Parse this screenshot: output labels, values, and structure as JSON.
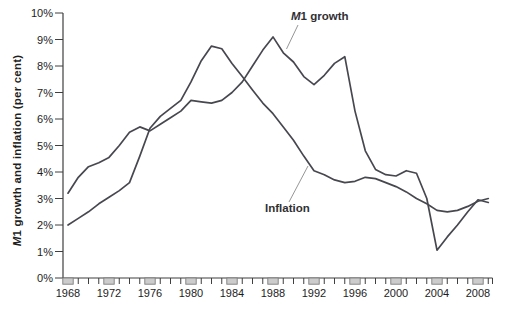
{
  "figure": {
    "ylabel": {
      "italic": "M",
      "rest": "1 growth and inflation (per cent)"
    },
    "series_labels": {
      "m1": {
        "italic": "M",
        "rest": "1 growth"
      },
      "inflation": "Inflation"
    },
    "colors": {
      "line": "#47474f",
      "axis": "#3f3f3f",
      "tick_text": "#1c1c1c",
      "leader": "#8a8a8a",
      "box_fill": "#cccccc",
      "box_stroke": "#7d7d7d"
    }
  },
  "chart_data": {
    "type": "line",
    "title": "",
    "xlabel": "",
    "ylabel": "M1 growth and inflation (per cent)",
    "xlim": [
      1968,
      2009.5
    ],
    "ylim": [
      0,
      10
    ],
    "grid": false,
    "legend_position": "inline-annotations",
    "y_tick_labels": [
      "0%",
      "1%",
      "2%",
      "3%",
      "4%",
      "5%",
      "6%",
      "7%",
      "8%",
      "9%",
      "10%"
    ],
    "x_labeled_ticks": [
      1968,
      1972,
      1976,
      1980,
      1984,
      1988,
      1992,
      1996,
      2000,
      2004,
      2008
    ],
    "x": [
      1968,
      1969,
      1970,
      1971,
      1972,
      1973,
      1974,
      1975,
      1976,
      1977,
      1978,
      1979,
      1980,
      1981,
      1982,
      1983,
      1984,
      1985,
      1986,
      1987,
      1988,
      1989,
      1990,
      1991,
      1992,
      1993,
      1994,
      1995,
      1996,
      1997,
      1998,
      1999,
      2000,
      2001,
      2002,
      2003,
      2004,
      2005,
      2006,
      2007,
      2008,
      2009
    ],
    "series": [
      {
        "name": "M1 growth",
        "values": [
          3.2,
          3.8,
          4.2,
          4.35,
          4.55,
          5.0,
          5.5,
          5.7,
          5.55,
          5.8,
          6.05,
          6.3,
          6.7,
          6.65,
          6.6,
          6.7,
          7.0,
          7.4,
          8.0,
          8.6,
          9.1,
          8.5,
          8.15,
          7.6,
          7.3,
          7.65,
          8.1,
          8.35,
          6.3,
          4.8,
          4.1,
          3.9,
          3.85,
          4.05,
          3.95,
          3.0,
          1.05,
          1.55,
          2.0,
          2.5,
          2.95,
          2.85
        ]
      },
      {
        "name": "Inflation",
        "values": [
          2.0,
          2.25,
          2.5,
          2.8,
          3.05,
          3.3,
          3.6,
          4.6,
          5.65,
          6.1,
          6.4,
          6.7,
          7.4,
          8.2,
          8.75,
          8.65,
          8.1,
          7.6,
          7.1,
          6.6,
          6.2,
          5.7,
          5.2,
          4.6,
          4.05,
          3.9,
          3.7,
          3.6,
          3.65,
          3.8,
          3.75,
          3.6,
          3.45,
          3.25,
          3.0,
          2.8,
          2.55,
          2.5,
          2.55,
          2.7,
          2.9,
          3.0
        ]
      }
    ],
    "annotations": [
      {
        "text": "M1 growth",
        "points_to": {
          "series": "M1 growth",
          "year": 1989
        }
      },
      {
        "text": "Inflation",
        "points_to": {
          "series": "Inflation",
          "year": 1991
        }
      }
    ]
  }
}
